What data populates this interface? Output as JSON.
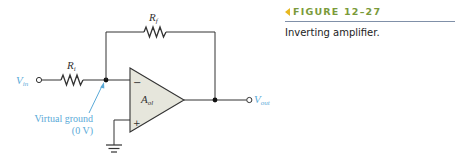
{
  "figure": {
    "number_label": "FIGURE 12–27",
    "description": "Inverting amplifier."
  },
  "circuit": {
    "input_label": "V",
    "input_sub": "in",
    "output_label": "V",
    "output_sub": "out",
    "input_resistor_label": "R",
    "input_resistor_sub": "i",
    "feedback_resistor_label": "R",
    "feedback_resistor_sub": "f",
    "opamp_label": "A",
    "opamp_sub": "ol",
    "inverting_sign": "−",
    "noninverting_sign": "+",
    "annotation_line1": "Virtual ground",
    "annotation_line2": "(0 V)"
  },
  "colors": {
    "wire": "#333333",
    "opamp_fill": "#e6e6dc",
    "annotation": "#5aaad8",
    "figure_title": "#7a9a3a",
    "figure_arrow": "#e8b820",
    "figure_rule": "#8090a8"
  }
}
